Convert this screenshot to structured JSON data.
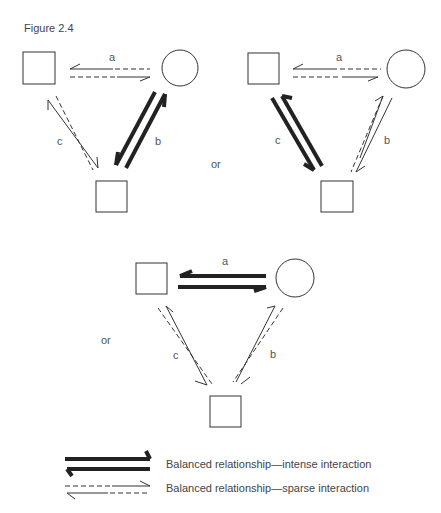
{
  "figure": {
    "title": "Figure 2.4",
    "connector_or_1": "or",
    "connector_or_2": "or",
    "diagrams": [
      {
        "id": "top-left",
        "a": "a",
        "b": "b",
        "c": "c",
        "intense": "b",
        "sparse": [
          "a",
          "c"
        ]
      },
      {
        "id": "top-right",
        "a": "a",
        "b": "b",
        "c": "c",
        "intense": "c",
        "sparse": [
          "a",
          "b"
        ]
      },
      {
        "id": "bottom",
        "a": "a",
        "b": "b",
        "c": "c",
        "intense": "a",
        "sparse": [
          "b",
          "c"
        ]
      }
    ],
    "legend": {
      "intense": "Balanced relationship—intense interaction",
      "sparse": "Balanced relationship—sparse interaction"
    }
  }
}
